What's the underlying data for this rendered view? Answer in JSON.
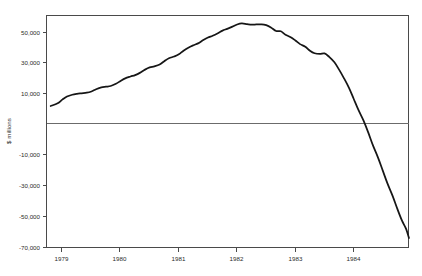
{
  "chart_data": {
    "type": "line",
    "title": "",
    "subtitle": "",
    "xlabel": "",
    "ylabel": "$ millions",
    "xlim": [
      1978.72,
      1984.95
    ],
    "ylim": [
      -70000,
      58000
    ],
    "grid": false,
    "legend": null,
    "zero_line": 0,
    "ytick_labels": [
      "50,000",
      "30,000",
      "10,000",
      "-10,000",
      "-30,000",
      "-50,000",
      "-70,000"
    ],
    "ytick_values": [
      50000,
      30000,
      10000,
      -10000,
      -30000,
      -50000,
      -70000
    ],
    "xtick_labels": [
      "1979",
      "1980",
      "1981",
      "1982",
      "1983",
      "1984"
    ],
    "xtick_values": [
      1979,
      1980,
      1981,
      1982,
      1983,
      1984
    ],
    "series": [
      {
        "name": "net position",
        "x": [
          1978.8,
          1978.92,
          1979.0,
          1979.08,
          1979.17,
          1979.25,
          1979.33,
          1979.42,
          1979.5,
          1979.58,
          1979.67,
          1979.75,
          1979.83,
          1979.92,
          1980.0,
          1980.08,
          1980.17,
          1980.25,
          1980.33,
          1980.42,
          1980.5,
          1980.58,
          1980.67,
          1980.75,
          1980.83,
          1980.92,
          1981.0,
          1981.08,
          1981.17,
          1981.25,
          1981.33,
          1981.42,
          1981.5,
          1981.58,
          1981.67,
          1981.75,
          1981.83,
          1981.92,
          1982.0,
          1982.08,
          1982.17,
          1982.25,
          1982.33,
          1982.42,
          1982.5,
          1982.58,
          1982.67,
          1982.75,
          1982.83,
          1982.92,
          1983.0,
          1983.08,
          1983.17,
          1983.25,
          1983.33,
          1983.42,
          1983.5,
          1983.58,
          1983.67,
          1983.75,
          1983.83,
          1983.92,
          1984.0,
          1984.08,
          1984.17,
          1984.25,
          1984.33,
          1984.42,
          1984.5,
          1984.58,
          1984.67,
          1984.75,
          1984.83,
          1984.9
        ],
        "y": [
          8000,
          9500,
          11500,
          13200,
          14200,
          14700,
          15000,
          15300,
          16000,
          17200,
          18200,
          18600,
          19000,
          20200,
          21800,
          23200,
          24200,
          25000,
          26200,
          28000,
          29200,
          29800,
          30800,
          32600,
          34200,
          35200,
          36400,
          38400,
          40200,
          41400,
          42400,
          44200,
          45600,
          46600,
          48000,
          49400,
          50400,
          51600,
          52800,
          53400,
          53000,
          52700,
          52800,
          52900,
          52400,
          51200,
          49200,
          49100,
          47200,
          45800,
          44000,
          42000,
          40600,
          38400,
          37000,
          36600,
          36900,
          35000,
          32000,
          28000,
          23500,
          18000,
          12000,
          6000,
          0,
          -6500,
          -13500,
          -20500,
          -27500,
          -34500,
          -41500,
          -48500,
          -55000,
          -59500
        ],
        "y_tail_x": [
          1984.9,
          1984.95
        ],
        "y_tail_y": [
          -59500,
          -64500
        ]
      }
    ]
  },
  "layout": {
    "plot_left_px": 46,
    "plot_right_px": 409,
    "plot_top_px": 15,
    "plot_bottom_px": 248
  }
}
